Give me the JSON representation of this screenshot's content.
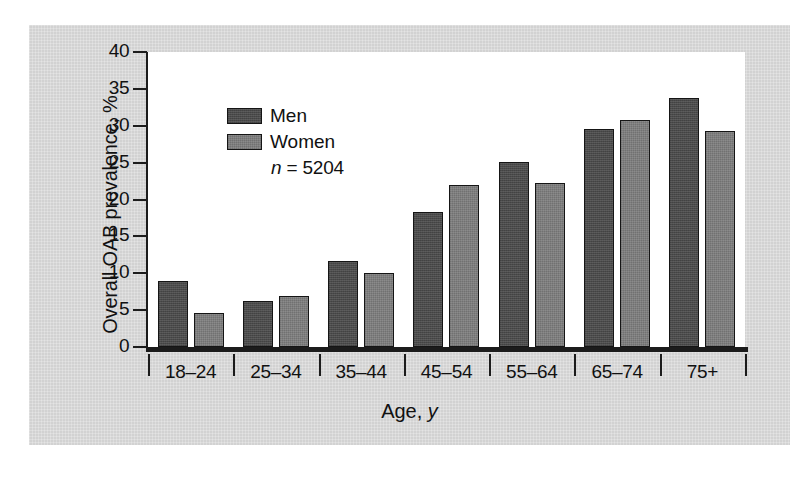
{
  "chart_data": {
    "type": "bar",
    "title": "",
    "xlabel": "Age, y",
    "ylabel": "Overall OAB prevalence, %",
    "categories": [
      "18–24",
      "25–34",
      "35–44",
      "45–54",
      "55–64",
      "65–74",
      "75+"
    ],
    "series": [
      {
        "name": "Men",
        "color": "#4b4b4b",
        "values": [
          9.0,
          6.3,
          11.7,
          18.3,
          25.1,
          29.6,
          33.8
        ]
      },
      {
        "name": "Women",
        "color": "#7e7e7e",
        "values": [
          4.6,
          6.9,
          10.1,
          22.0,
          22.3,
          30.8,
          29.3
        ]
      }
    ],
    "ylim": [
      0,
      40
    ],
    "yticks": [
      0,
      5,
      10,
      15,
      20,
      25,
      30,
      35,
      40
    ],
    "ytick_labels": [
      "0",
      "5",
      "10",
      "15",
      "20",
      "25",
      "30",
      "35",
      "40"
    ],
    "grid": false,
    "legend_position": "top-left-inside",
    "annotations": [
      {
        "text": "n = 5204",
        "italic_prefix": "n",
        "rest": " = 5204"
      }
    ]
  },
  "axes": {
    "y_title": "Overall OAB prevalence, %",
    "x_title_prefix": "Age, ",
    "x_title_italic": "y"
  },
  "legend": {
    "items": [
      {
        "label": "Men",
        "color": "#4b4b4b"
      },
      {
        "label": "Women",
        "color": "#7e7e7e"
      }
    ],
    "n_prefix": "n",
    "n_value": " = 5204"
  },
  "colors": {
    "men": "#4b4b4b",
    "women": "#7e7e7e",
    "figure_background": "#d2d2d2",
    "panel_background": "#ffffff",
    "axis": "#1c1c1c",
    "text": "#111111"
  }
}
